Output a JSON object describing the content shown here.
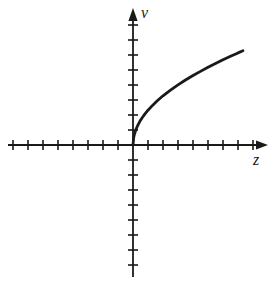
{
  "figure": {
    "title": "",
    "background_color": "#ffffff",
    "stroke_color": "#1a1a1a"
  },
  "axes": {
    "x": {
      "label": "z",
      "label_style": "italic",
      "arrow": "right-arrow-icon",
      "origin_px": 133,
      "start_px": 8,
      "end_px": 268,
      "tick_spacing_px": 15,
      "ticks_negative": 8,
      "ticks_positive": 8,
      "tick_half_length_px": 5,
      "tick_labels": []
    },
    "y": {
      "label": "v",
      "label_style": "italic",
      "arrow": "up-arrow-icon",
      "origin_px": 145,
      "start_px": 277,
      "end_px": 8,
      "tick_spacing_px": 15,
      "ticks_positive": 8,
      "ticks_negative": 8,
      "tick_half_length_px": 5,
      "tick_labels": []
    }
  },
  "chart_data": {
    "type": "line",
    "title": "",
    "xlabel": "z",
    "ylabel": "v",
    "grid": false,
    "legend": null,
    "xlim": [
      -8.3,
      9.0
    ],
    "ylim": [
      -8.8,
      9.1
    ],
    "series": [
      {
        "name": "v = k·sqrt(z)",
        "description": "square-root shaped increasing concave curve starting at the origin with a vertical tangent",
        "x": [
          0.0,
          0.05,
          0.1,
          0.2,
          0.3,
          0.45,
          0.6,
          0.8,
          1.0,
          1.3,
          1.6,
          2.0,
          2.5,
          3.0,
          3.5,
          4.0,
          4.5,
          5.0,
          5.5,
          6.0,
          6.5,
          7.0,
          7.33
        ],
        "y": [
          0.0,
          0.52,
          0.73,
          1.04,
          1.27,
          1.56,
          1.8,
          2.07,
          2.32,
          2.64,
          2.93,
          3.28,
          3.66,
          4.01,
          4.33,
          4.63,
          4.91,
          5.18,
          5.43,
          5.68,
          5.91,
          6.14,
          6.28
        ]
      }
    ],
    "annotations": []
  }
}
